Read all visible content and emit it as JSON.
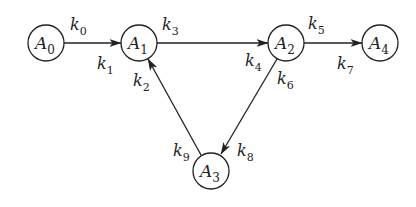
{
  "diagram": {
    "title": "",
    "colors": {
      "stroke": "#222222",
      "background": "#ffffff"
    },
    "nodes": [
      {
        "id": "A0",
        "base": "A",
        "sub": "0",
        "cx": 46,
        "cy": 43,
        "r": 18
      },
      {
        "id": "A1",
        "base": "A",
        "sub": "1",
        "cx": 139,
        "cy": 43,
        "r": 18
      },
      {
        "id": "A2",
        "base": "A",
        "sub": "2",
        "cx": 286,
        "cy": 43,
        "r": 18
      },
      {
        "id": "A3",
        "base": "A",
        "sub": "3",
        "cx": 211,
        "cy": 171,
        "r": 18
      },
      {
        "id": "A4",
        "base": "A",
        "sub": "4",
        "cx": 380,
        "cy": 43,
        "r": 18
      }
    ],
    "edges": [
      {
        "from": "A0",
        "to": "A1",
        "x1": 64,
        "y1": 43,
        "x2": 121,
        "y2": 43
      },
      {
        "from": "A1",
        "to": "A2",
        "x1": 157,
        "y1": 43,
        "x2": 268,
        "y2": 43
      },
      {
        "from": "A2",
        "to": "A4",
        "x1": 304,
        "y1": 43,
        "x2": 362,
        "y2": 43
      },
      {
        "from": "A2",
        "to": "A3",
        "x1": 277,
        "y1": 59,
        "x2": 221,
        "y2": 154
      },
      {
        "from": "A3",
        "to": "A1",
        "x1": 201,
        "y1": 155,
        "x2": 148,
        "y2": 59
      }
    ],
    "rates": [
      {
        "id": "k0",
        "base": "k",
        "sub": "0",
        "x": 70,
        "y": 30
      },
      {
        "id": "k1",
        "base": "k",
        "sub": "1",
        "x": 97,
        "y": 69
      },
      {
        "id": "k2",
        "base": "k",
        "sub": "2",
        "x": 133,
        "y": 86
      },
      {
        "id": "k3",
        "base": "k",
        "sub": "3",
        "x": 162,
        "y": 30
      },
      {
        "id": "k4",
        "base": "k",
        "sub": "4",
        "x": 245,
        "y": 66
      },
      {
        "id": "k5",
        "base": "k",
        "sub": "5",
        "x": 308,
        "y": 29
      },
      {
        "id": "k6",
        "base": "k",
        "sub": "6",
        "x": 277,
        "y": 84
      },
      {
        "id": "k7",
        "base": "k",
        "sub": "7",
        "x": 337,
        "y": 69
      },
      {
        "id": "k8",
        "base": "k",
        "sub": "8",
        "x": 237,
        "y": 156
      },
      {
        "id": "k9",
        "base": "k",
        "sub": "9",
        "x": 173,
        "y": 156
      }
    ]
  }
}
